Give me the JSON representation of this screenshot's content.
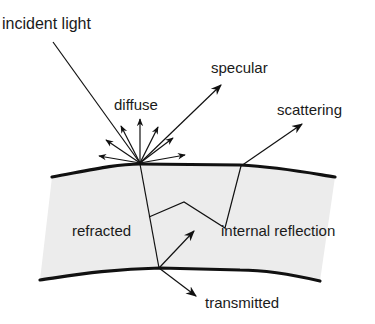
{
  "figure": {
    "labels": {
      "incident": "incident light",
      "diffuse": "diffuse",
      "specular": "specular",
      "scattering": "scattering",
      "refracted": "refracted",
      "internal_reflection": "internal reflection",
      "transmitted": "transmitted"
    },
    "colors": {
      "background": "#ffffff",
      "layer_fill": "#ececec",
      "line": "#111111",
      "text": "#1a1a1a"
    }
  }
}
